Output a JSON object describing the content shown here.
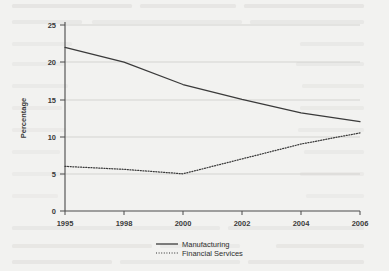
{
  "chart_data": {
    "type": "line",
    "title": "",
    "xlabel": "",
    "ylabel": "Percentage",
    "categories": [
      "1995",
      "1998",
      "2000",
      "2002",
      "2004",
      "2006"
    ],
    "x_tick_labels": [
      "1995",
      "1998",
      "2000",
      "2002",
      "2004",
      "2006"
    ],
    "y_tick_labels": [
      "0",
      "5",
      "10",
      "15",
      "20",
      "25"
    ],
    "y_ticks": [
      0,
      5,
      10,
      15,
      20,
      25
    ],
    "ylim": [
      0,
      25
    ],
    "grid": true,
    "grid_axis": "y",
    "legend_position": "bottom-center",
    "series": [
      {
        "name": "Manufacturing",
        "style": "solid",
        "color": "#3a3a3a",
        "values": [
          22.0,
          20.0,
          17.0,
          15.0,
          13.2,
          12.0
        ]
      },
      {
        "name": "Financial Services",
        "style": "dotted",
        "color": "#3a3a3a",
        "values": [
          6.0,
          5.6,
          5.0,
          7.0,
          9.0,
          10.5
        ]
      }
    ]
  },
  "legend": {
    "entries": [
      {
        "label": "Manufacturing",
        "style": "solid"
      },
      {
        "label": "Financial Services",
        "style": "dotted"
      }
    ]
  },
  "axes": {
    "y_title": "Percentage"
  },
  "colors": {
    "background": "#f2f2f0",
    "axis": "#4a4a4a",
    "grid": "#c9c9c4",
    "ink": "#3a3a3a"
  }
}
